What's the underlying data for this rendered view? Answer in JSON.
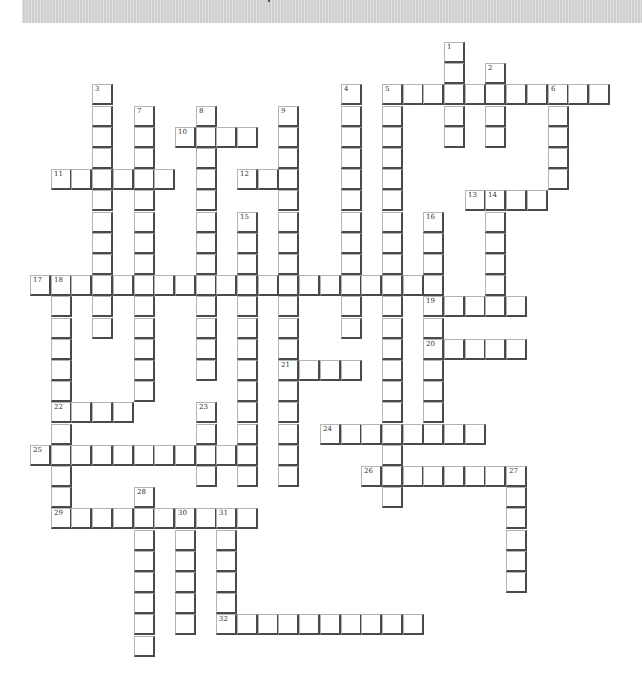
{
  "puzzle": {
    "type": "crossword",
    "grid": {
      "origin_x": 30,
      "origin_y": 42,
      "pitch_x": 20.7,
      "pitch_y": 21.2,
      "cols": 28,
      "rows": 29
    },
    "colors": {
      "cell_bg": "#ffffff",
      "cell_dark_edge": "#4a4a4a",
      "cell_light_edge": "#b4b4b4",
      "banner": "#d6d6d6"
    },
    "entries": [
      {
        "num": "1",
        "dir": "down",
        "col": 20,
        "row": 0,
        "len": 5
      },
      {
        "num": "2",
        "dir": "down",
        "col": 22,
        "row": 1,
        "len": 4
      },
      {
        "num": "3",
        "dir": "down",
        "col": 3,
        "row": 2,
        "len": 12
      },
      {
        "num": "4",
        "dir": "down",
        "col": 15,
        "row": 2,
        "len": 12
      },
      {
        "num": "5",
        "dir": "across",
        "col": 17,
        "row": 2,
        "len": 11
      },
      {
        "num": "5",
        "dir": "down",
        "col": 17,
        "row": 2,
        "len": 20
      },
      {
        "num": "6",
        "dir": "down",
        "col": 25,
        "row": 2,
        "len": 5
      },
      {
        "num": "7",
        "dir": "down",
        "col": 5,
        "row": 3,
        "len": 14
      },
      {
        "num": "8",
        "dir": "down",
        "col": 8,
        "row": 3,
        "len": 13
      },
      {
        "num": "9",
        "dir": "down",
        "col": 12,
        "row": 3,
        "len": 18
      },
      {
        "num": "10",
        "dir": "across",
        "col": 7,
        "row": 4,
        "len": 4
      },
      {
        "num": "11",
        "dir": "across",
        "col": 1,
        "row": 6,
        "len": 6
      },
      {
        "num": "12",
        "dir": "across",
        "col": 10,
        "row": 6,
        "len": 3
      },
      {
        "num": "13",
        "dir": "across",
        "col": 21,
        "row": 7,
        "len": 4
      },
      {
        "num": "14",
        "dir": "down",
        "col": 22,
        "row": 7,
        "len": 5
      },
      {
        "num": "15",
        "dir": "down",
        "col": 10,
        "row": 8,
        "len": 13
      },
      {
        "num": "16",
        "dir": "down",
        "col": 19,
        "row": 8,
        "len": 11
      },
      {
        "num": "17",
        "dir": "across",
        "col": 0,
        "row": 11,
        "len": 20
      },
      {
        "num": "18",
        "dir": "down",
        "col": 1,
        "row": 11,
        "len": 12
      },
      {
        "num": "19",
        "dir": "across",
        "col": 19,
        "row": 12,
        "len": 5
      },
      {
        "num": "20",
        "dir": "across",
        "col": 19,
        "row": 14,
        "len": 5
      },
      {
        "num": "21",
        "dir": "across",
        "col": 12,
        "row": 15,
        "len": 4
      },
      {
        "num": "22",
        "dir": "across",
        "col": 1,
        "row": 17,
        "len": 4
      },
      {
        "num": "23",
        "dir": "down",
        "col": 8,
        "row": 17,
        "len": 4
      },
      {
        "num": "24",
        "dir": "across",
        "col": 14,
        "row": 18,
        "len": 8
      },
      {
        "num": "25",
        "dir": "across",
        "col": 0,
        "row": 19,
        "len": 11
      },
      {
        "num": "26",
        "dir": "across",
        "col": 16,
        "row": 20,
        "len": 8
      },
      {
        "num": "27",
        "dir": "down",
        "col": 23,
        "row": 20,
        "len": 6
      },
      {
        "num": "28",
        "dir": "down",
        "col": 5,
        "row": 21,
        "len": 8
      },
      {
        "num": "29",
        "dir": "across",
        "col": 1,
        "row": 22,
        "len": 10
      },
      {
        "num": "30",
        "dir": "down",
        "col": 7,
        "row": 22,
        "len": 6
      },
      {
        "num": "31",
        "dir": "down",
        "col": 9,
        "row": 22,
        "len": 6
      },
      {
        "num": "32",
        "dir": "across",
        "col": 9,
        "row": 27,
        "len": 10
      }
    ]
  }
}
